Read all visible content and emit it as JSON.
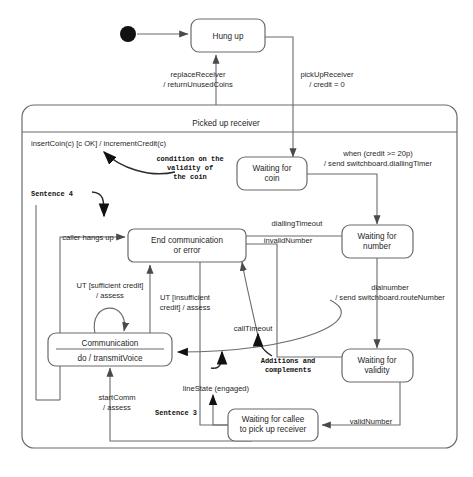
{
  "diagram": {
    "composite_state": {
      "name": "Picked up receiver"
    },
    "initial_state": {
      "name": "initial-pseudostate"
    },
    "states": [
      {
        "id": "hung_up",
        "label": "Hung up"
      },
      {
        "id": "wait_coin",
        "label_line1": "Waiting for",
        "label_line2": "coin"
      },
      {
        "id": "end_comm",
        "label_line1": "End communication",
        "label_line2": "or error"
      },
      {
        "id": "wait_num",
        "label_line1": "Waiting for",
        "label_line2": "number"
      },
      {
        "id": "comm",
        "label": "Communication",
        "activity": "do / transmitVoice"
      },
      {
        "id": "wait_val",
        "label_line1": "Waiting for",
        "label_line2": "validity"
      },
      {
        "id": "wait_callee",
        "label_line1": "Waiting for callee",
        "label_line2": "to pick up receiver"
      }
    ],
    "transitions": [
      {
        "id": "replace",
        "line1": "replaceReceiver",
        "line2": "/ returnUnusedCoins"
      },
      {
        "id": "pickup",
        "line1": "pickUpReceiver",
        "line2": "/ credit = 0"
      },
      {
        "id": "insertcoin",
        "line1": "insertCoin(c) [c OK] / incrementCredit(c)"
      },
      {
        "id": "credit20",
        "line1": "when (credit >= 20p)",
        "line2": "/ send switchboard.diallingTimer"
      },
      {
        "id": "diallingto",
        "line1": "diallingTimeout"
      },
      {
        "id": "invalidnum",
        "line1": "invalidNumber"
      },
      {
        "id": "dialnumber",
        "line1": "dialnumber",
        "line2": "/ send switchboard.routeNumber"
      },
      {
        "id": "callerhangs",
        "line1": "caller hangs up"
      },
      {
        "id": "utsuff",
        "line1": "UT [sufficient credit]",
        "line2": "/ assess"
      },
      {
        "id": "utinsuff",
        "line1": "UT [insufficient",
        "line2": "credit] / assess"
      },
      {
        "id": "calltimeout",
        "line1": "callTimeout"
      },
      {
        "id": "startcomm",
        "line1": "startComm",
        "line2": "/ assess"
      },
      {
        "id": "linestate",
        "line1": "lineState (engaged)"
      },
      {
        "id": "validnumber",
        "line1": "validNumber"
      }
    ],
    "annotations": [
      {
        "id": "coin_condition",
        "line1": "condition on the",
        "line2": "validity of",
        "line3": "the coin"
      },
      {
        "id": "sentence4",
        "line1": "Sentence 4"
      },
      {
        "id": "additions",
        "line1": "Additions and",
        "line2": "complements"
      },
      {
        "id": "sentence3",
        "line1": "Sentence 3"
      }
    ],
    "colors": {
      "stroke": "#6b6b6b",
      "text": "#1f1f1f",
      "annotation": "#111111",
      "background": "#ffffff"
    }
  }
}
